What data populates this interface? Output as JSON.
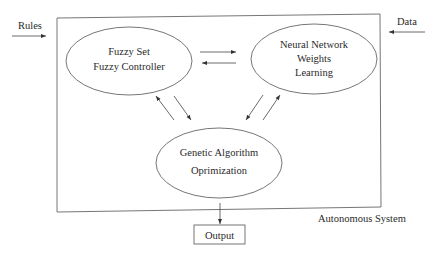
{
  "diagram": {
    "external_inputs": {
      "rules": "Rules",
      "data": "Data"
    },
    "nodes": {
      "fuzzy": {
        "line1": "Fuzzy Set",
        "line2": "Fuzzy Controller"
      },
      "neural": {
        "line1": "Neural Network",
        "line2": "Weights",
        "line3": "Learning"
      },
      "genetic": {
        "line1": "Genetic Algorithm",
        "line2": "Oprimization"
      }
    },
    "container_label": "Autonomous System",
    "output": "Output",
    "colors": {
      "stroke": "#555555",
      "text": "#2a2a2a"
    }
  }
}
